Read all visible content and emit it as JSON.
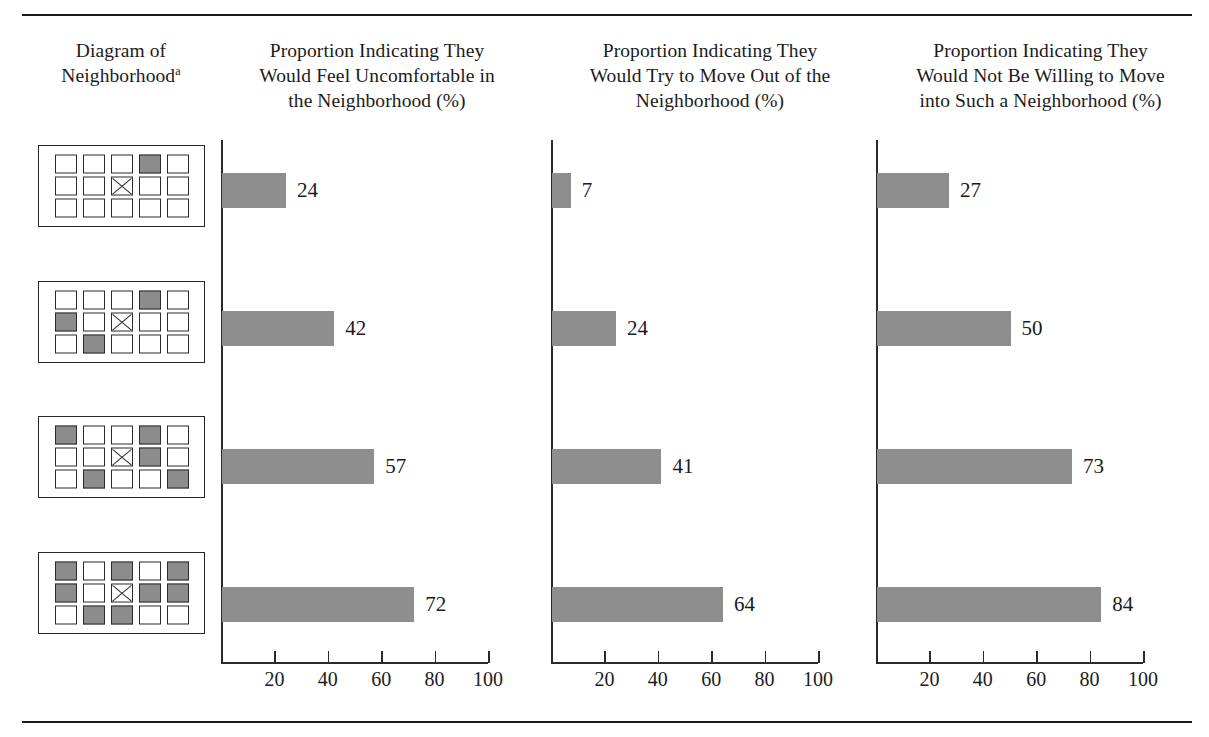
{
  "table": {
    "column_headers": {
      "diagram": [
        "Diagram of",
        "Neighborhood"
      ],
      "diagram_footnote_marker": "a",
      "col1": [
        "Proportion Indicating They",
        "Would Feel Uncomfortable in",
        "the Neighborhood (%)"
      ],
      "col2": [
        "Proportion Indicating They",
        "Would Try to Move Out of the",
        "Neighborhood (%)"
      ],
      "col3": [
        "Proportion Indicating They",
        "Would Not Be Willing to Move",
        "into Such a Neighborhood (%)"
      ]
    }
  },
  "axis": {
    "ticks": [
      20,
      40,
      60,
      80,
      100
    ],
    "tick_labels": [
      "20",
      "40",
      "60",
      "80",
      "100"
    ],
    "min": 0,
    "max": 100
  },
  "diagrams": [
    {
      "rows": 3,
      "cols": 5,
      "filled": [
        [
          0,
          3
        ]
      ],
      "x_marks": [
        [
          1,
          2
        ]
      ]
    },
    {
      "rows": 3,
      "cols": 5,
      "filled": [
        [
          0,
          3
        ],
        [
          1,
          0
        ],
        [
          2,
          1
        ]
      ],
      "x_marks": [
        [
          1,
          2
        ]
      ]
    },
    {
      "rows": 3,
      "cols": 5,
      "filled": [
        [
          0,
          0
        ],
        [
          0,
          3
        ],
        [
          1,
          3
        ],
        [
          2,
          1
        ],
        [
          2,
          4
        ]
      ],
      "x_marks": [
        [
          1,
          2
        ]
      ]
    },
    {
      "rows": 3,
      "cols": 5,
      "filled": [
        [
          0,
          0
        ],
        [
          0,
          2
        ],
        [
          0,
          4
        ],
        [
          1,
          0
        ],
        [
          1,
          3
        ],
        [
          1,
          4
        ],
        [
          2,
          1
        ],
        [
          2,
          2
        ]
      ],
      "x_marks": [
        [
          1,
          2
        ]
      ]
    }
  ],
  "chart_data": {
    "type": "bar",
    "orientation": "horizontal",
    "title": "",
    "xlabel": "",
    "ylabel": "",
    "xlim": [
      0,
      100
    ],
    "grid": false,
    "legend": "none",
    "categories": [
      "Neighborhood 1",
      "Neighborhood 2",
      "Neighborhood 3",
      "Neighborhood 4"
    ],
    "tick_values": [
      20,
      40,
      60,
      80,
      100
    ],
    "series": [
      {
        "name": "Proportion Indicating They Would Feel Uncomfortable in the Neighborhood (%)",
        "values": [
          24,
          42,
          57,
          72
        ]
      },
      {
        "name": "Proportion Indicating They Would Try to Move Out of the Neighborhood (%)",
        "values": [
          7,
          24,
          41,
          64
        ]
      },
      {
        "name": "Proportion Indicating They Would Not Be Willing to Move into Such a Neighborhood (%)",
        "values": [
          27,
          50,
          73,
          84
        ]
      }
    ]
  },
  "colors": {
    "bar_fill": "#8e8e8e",
    "rule": "#1a1a1a",
    "text": "#1b1b1b",
    "cell_filled": "#8c8c8c"
  }
}
